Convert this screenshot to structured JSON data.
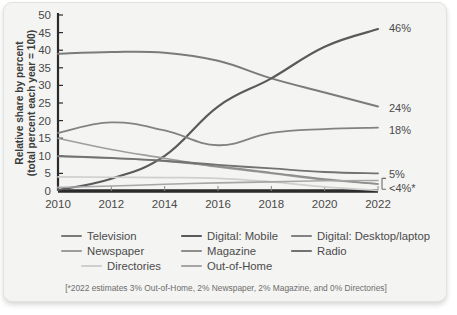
{
  "chart_data": {
    "type": "line",
    "title": "",
    "xlabel": "",
    "ylabel": "Relative share by percent (total percent each year = 100)",
    "ylabel_line1": "Relative share by percent",
    "ylabel_line2": "(total percent each year = 100)",
    "x": [
      2010,
      2012,
      2014,
      2016,
      2018,
      2020,
      2022
    ],
    "xtick_labels": [
      "2010",
      "2012",
      "2014",
      "2016",
      "2018",
      "2020",
      "2022"
    ],
    "ytick_labels": [
      "0",
      "5",
      "10",
      "15",
      "20",
      "25",
      "30",
      "35",
      "40",
      "45",
      "50"
    ],
    "yticks": [
      0,
      5,
      10,
      15,
      20,
      25,
      30,
      35,
      40,
      45,
      50
    ],
    "ylim": [
      0,
      50
    ],
    "xlim": [
      2010,
      2022
    ],
    "grid": false,
    "legend_position": "bottom",
    "series": [
      {
        "name": "Television",
        "color": "#7b7b7b",
        "width": 2.0,
        "values": [
          39,
          39.5,
          39.3,
          37,
          32,
          28,
          24
        ],
        "end_label": "24%"
      },
      {
        "name": "Digital: Mobile",
        "color": "#5a5a5a",
        "width": 2.2,
        "values": [
          0.3,
          3.5,
          10,
          24,
          32,
          41,
          46
        ],
        "end_label": "46%"
      },
      {
        "name": "Digital: Desktop/laptop",
        "color": "#828282",
        "width": 1.8,
        "values": [
          16.5,
          19.5,
          17.2,
          13,
          16.5,
          17.6,
          18
        ],
        "end_label": "18%"
      },
      {
        "name": "Newspaper",
        "color": "#9d9d9d",
        "width": 1.6,
        "values": [
          15,
          11.8,
          9.3,
          6.8,
          5,
          3.2,
          2
        ],
        "end_label": ""
      },
      {
        "name": "Magazine",
        "color": "#8e8e8e",
        "width": 1.6,
        "values": [
          9.8,
          9.3,
          8.5,
          7,
          5.2,
          3.4,
          2
        ],
        "end_label": ""
      },
      {
        "name": "Radio",
        "color": "#727272",
        "width": 1.8,
        "values": [
          10,
          9.4,
          8.6,
          7.4,
          6.4,
          5.4,
          5
        ],
        "end_label": "5%"
      },
      {
        "name": "Directories",
        "color": "#cfcfcf",
        "width": 1.7,
        "values": [
          4,
          3.9,
          3.8,
          3.6,
          2.6,
          1.2,
          0.2
        ],
        "end_label": ""
      },
      {
        "name": "Out-of-Home",
        "color": "#a6a6a6",
        "width": 1.6,
        "values": [
          1.0,
          1.4,
          1.9,
          2.3,
          2.6,
          2.9,
          3.0
        ],
        "end_label": ""
      }
    ],
    "annotations": [
      {
        "text": "46%",
        "value": 46,
        "series": "Digital: Mobile"
      },
      {
        "text": "24%",
        "value": 24,
        "series": "Television"
      },
      {
        "text": "18%",
        "value": 18,
        "series": "Digital: Desktop/laptop"
      },
      {
        "text": "5%",
        "value": 5,
        "series": "Radio"
      },
      {
        "text": "<4%*",
        "value": 3,
        "series": "Out-of-Home / Newspaper / Magazine / Directories"
      }
    ],
    "footnote": "[*2022 estimates 3% Out-of-Home, 2% Newspaper, 2% Magazine, and 0% Directories]"
  },
  "legend": {
    "rows": [
      [
        {
          "label": "Television",
          "color": "#7b7b7b"
        },
        {
          "label": "Digital: Mobile",
          "color": "#5a5a5a"
        },
        {
          "label": "Digital: Desktop/laptop",
          "color": "#828282"
        }
      ],
      [
        {
          "label": "Newspaper",
          "color": "#9d9d9d"
        },
        {
          "label": "Magazine",
          "color": "#8e8e8e"
        },
        {
          "label": "Radio",
          "color": "#727272"
        }
      ],
      [
        {
          "label": "Directories",
          "color": "#cfcfcf"
        },
        {
          "label": "Out-of-Home",
          "color": "#a6a6a6"
        }
      ]
    ]
  },
  "style": {
    "card_background": "#f4f4f2",
    "axis_color": "#2b2b2b",
    "text_color": "#4a4a4a"
  }
}
